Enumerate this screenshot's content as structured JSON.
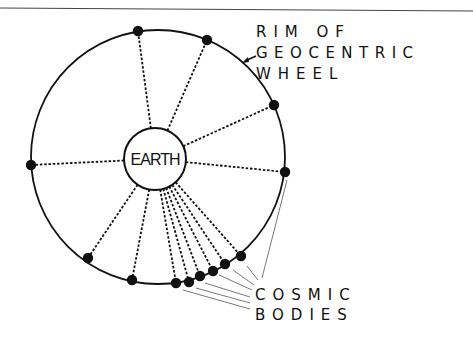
{
  "diagram": {
    "title": "Geocentric wheel",
    "center_label": "EARTH",
    "rim_label": [
      "RIM OF",
      "GEOCENTRIC",
      "WHEEL"
    ],
    "bodies_label": [
      "COSMIC",
      "BODIES"
    ],
    "colors": {
      "ink": "#111111",
      "background": "#ffffff",
      "pointer": "#555555"
    },
    "wheel": {
      "cx": 158,
      "cy": 157,
      "r": 127
    },
    "earth": {
      "cx": 155,
      "cy": 159,
      "r": 31
    },
    "bodies": [
      {
        "x": 138,
        "y": 31
      },
      {
        "x": 207,
        "y": 40
      },
      {
        "x": 274,
        "y": 105
      },
      {
        "x": 285,
        "y": 172
      },
      {
        "x": 31,
        "y": 165
      },
      {
        "x": 88,
        "y": 258
      },
      {
        "x": 132,
        "y": 280
      },
      {
        "x": 176,
        "y": 283
      },
      {
        "x": 189,
        "y": 282
      },
      {
        "x": 200,
        "y": 276
      },
      {
        "x": 213,
        "y": 271
      },
      {
        "x": 225,
        "y": 264
      },
      {
        "x": 241,
        "y": 256
      }
    ]
  }
}
